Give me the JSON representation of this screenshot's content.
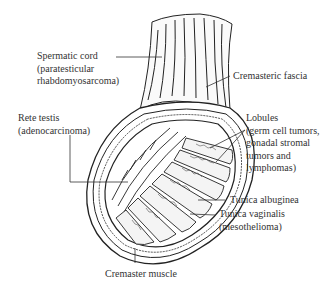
{
  "figure": {
    "labels": {
      "spermatic_cord": {
        "lines": [
          "Spermatic cord",
          "(paratesticular",
          "rhabdomyosarcoma)"
        ]
      },
      "cremasteric_fascia": {
        "lines": [
          "Cremasteric fascia"
        ]
      },
      "rete_testis": {
        "lines": [
          "Rete testis",
          "(adenocarcinoma)"
        ]
      },
      "lobules": {
        "lines": [
          "Lobules",
          "(germ cell tumors,",
          "gonadal stromal",
          "tumors and",
          "lymphomas)"
        ]
      },
      "tunica_albuginea": {
        "lines": [
          "Tunica albuginea"
        ]
      },
      "tunica_vaginalis": {
        "lines": [
          "Tunica vaginalis",
          "(mesothelioma)"
        ]
      },
      "cremaster_muscle": {
        "lines": [
          "Cremaster muscle"
        ]
      }
    }
  }
}
